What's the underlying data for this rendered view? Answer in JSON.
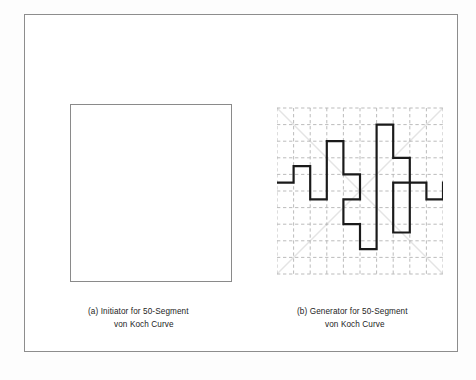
{
  "figure": {
    "title_implicit": "",
    "panels": [
      {
        "id": "a",
        "label": "(a)",
        "caption_line1": "(a)  Initiator for 50-Segment",
        "caption_line2": "von Koch Curve",
        "content_type": "empty-square-initiator"
      },
      {
        "id": "b",
        "label": "(b)",
        "caption_line1": "(b)  Generator for 50-Segment",
        "caption_line2": "von Koch Curve",
        "content_type": "grid-with-polyline-generator"
      }
    ]
  },
  "colors": {
    "frame_border": "#8d8d8d",
    "square_border": "#8a8a8a",
    "grid_dash": "#b4b4b4",
    "diagonal_guide": "#e2e2e2",
    "curve_stroke": "#1a1a1a",
    "background": "#ffffff",
    "text": "#1d1d1d"
  },
  "chart_data": {
    "type": "line",
    "title": "Generator for 50-Segment von Koch Curve",
    "xlabel": "",
    "ylabel": "",
    "xlim": [
      0,
      10
    ],
    "ylim": [
      0,
      10
    ],
    "grid": true,
    "grid_style": "dashed",
    "grid_cells_x": 10,
    "grid_cells_y": 10,
    "legend": "none",
    "annotations": [
      "diagonal guide lines from corner to corner (light grey)"
    ],
    "series": [
      {
        "name": "generator-polyline",
        "description": "Orthogonal staircase polyline of unit segments on a 10x10 lattice, starting at left edge and ending at right edge at the same height.",
        "points": [
          [
            0,
            5.5
          ],
          [
            1,
            5.5
          ],
          [
            1,
            6.5
          ],
          [
            2,
            6.5
          ],
          [
            2,
            4.5
          ],
          [
            3,
            4.5
          ],
          [
            3,
            8.0
          ],
          [
            4,
            8.0
          ],
          [
            4,
            6.0
          ],
          [
            5,
            6.0
          ],
          [
            5,
            4.5
          ],
          [
            4,
            4.5
          ],
          [
            4,
            3.0
          ],
          [
            5,
            3.0
          ],
          [
            5,
            1.5
          ],
          [
            6,
            1.5
          ],
          [
            6,
            9.0
          ],
          [
            7,
            9.0
          ],
          [
            7,
            7.0
          ],
          [
            8,
            7.0
          ],
          [
            8,
            2.5
          ],
          [
            7,
            2.5
          ],
          [
            7,
            5.5
          ],
          [
            9,
            5.5
          ],
          [
            9,
            4.5
          ],
          [
            10,
            4.5
          ],
          [
            10,
            5.5
          ]
        ]
      }
    ]
  }
}
